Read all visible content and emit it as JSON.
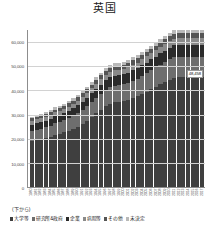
{
  "chart": {
    "title": "英国",
    "note": "(下から)",
    "y_axis": {
      "ticks": [
        "60,000",
        "50,000",
        "40,000",
        "30,000",
        "20,000",
        "10,000",
        "0"
      ],
      "max": 65000,
      "min": 0
    },
    "data_label": "48,458"
  },
  "legend": {
    "items": [
      {
        "label": "大学等",
        "color": "#3f3f3f"
      },
      {
        "label": "研究所&政府",
        "color": "#6e6e6e"
      },
      {
        "label": "企業",
        "color": "#2b2b2b"
      },
      {
        "label": "病院等",
        "color": "#8a8a8a"
      },
      {
        "label": "その他",
        "color": "#555555"
      },
      {
        "label": "未決定",
        "color": "#b9b9b9"
      }
    ]
  },
  "chart_data": {
    "type": "bar",
    "stacked": true,
    "title": "英国",
    "xlabel": "",
    "ylabel": "",
    "ylim": [
      0,
      65000
    ],
    "grid": true,
    "legend_position": "bottom",
    "annotations": [
      "48,458"
    ],
    "categories": [
      "1980",
      "1981",
      "1982",
      "1983",
      "1984",
      "1985",
      "1986",
      "1987",
      "1988",
      "1989",
      "1990",
      "1991",
      "1992",
      "1993",
      "1994",
      "1995",
      "1996",
      "1997",
      "1998",
      "1999",
      "2000",
      "2001",
      "2002",
      "2003",
      "2004",
      "2005",
      "2006",
      "2007",
      "2008",
      "2009",
      "2010",
      "2011",
      "2012",
      "2013",
      "2014",
      "2015",
      "2016",
      "2017"
    ],
    "series": [
      {
        "name": "大学等",
        "values": [
          19000,
          19500,
          19800,
          20200,
          20800,
          21500,
          22000,
          22600,
          23200,
          24000,
          25000,
          26200,
          27500,
          29000,
          30500,
          32000,
          33500,
          34500,
          35000,
          35200,
          35500,
          36000,
          36800,
          37500,
          38500,
          39500,
          40500,
          41500,
          42500,
          43500,
          44500,
          45200,
          45800,
          46300,
          46800,
          47300,
          47800,
          48458
        ]
      },
      {
        "name": "研究所&政府",
        "values": [
          4200,
          4300,
          4400,
          4500,
          4600,
          4800,
          4900,
          5000,
          5200,
          5400,
          5600,
          5800,
          6000,
          6200,
          6400,
          6600,
          6800,
          6900,
          7000,
          7000,
          7100,
          7200,
          7300,
          7400,
          7600,
          7700,
          7900,
          8000,
          8200,
          8300,
          8500,
          8600,
          8700,
          8800,
          8900,
          9000,
          9100,
          9200
        ]
      },
      {
        "name": "企業",
        "values": [
          2600,
          2650,
          2700,
          2750,
          2800,
          2900,
          2950,
          3000,
          3100,
          3200,
          3300,
          3400,
          3500,
          3600,
          3700,
          3800,
          3900,
          3950,
          4000,
          4000,
          4050,
          4100,
          4150,
          4200,
          4300,
          4350,
          4400,
          4500,
          4600,
          4650,
          4750,
          4800,
          4850,
          4900,
          4950,
          5000,
          5050,
          5100
        ]
      },
      {
        "name": "病院等",
        "values": [
          1500,
          1530,
          1560,
          1590,
          1620,
          1680,
          1710,
          1740,
          1800,
          1860,
          1920,
          1980,
          2040,
          2100,
          2160,
          2220,
          2280,
          2310,
          2340,
          2340,
          2370,
          2400,
          2430,
          2460,
          2520,
          2550,
          2580,
          2640,
          2700,
          2730,
          2790,
          2820,
          2850,
          2880,
          2910,
          2940,
          2970,
          3000
        ]
      },
      {
        "name": "その他",
        "values": [
          1100,
          1120,
          1140,
          1160,
          1180,
          1220,
          1240,
          1260,
          1300,
          1340,
          1380,
          1420,
          1460,
          1500,
          1540,
          1580,
          1620,
          1640,
          1660,
          1660,
          1680,
          1700,
          1720,
          1740,
          1780,
          1800,
          1820,
          1860,
          1900,
          1920,
          1960,
          1980,
          2000,
          2020,
          2040,
          2060,
          2080,
          2100
        ]
      },
      {
        "name": "未決定",
        "values": [
          800,
          810,
          820,
          830,
          850,
          880,
          890,
          900,
          930,
          960,
          990,
          1020,
          1050,
          1080,
          1110,
          1140,
          1170,
          1185,
          1200,
          1200,
          1215,
          1230,
          1245,
          1260,
          1290,
          1305,
          1320,
          1350,
          1380,
          1395,
          1425,
          1440,
          1455,
          1470,
          1485,
          1500,
          1515,
          1530
        ]
      }
    ]
  }
}
